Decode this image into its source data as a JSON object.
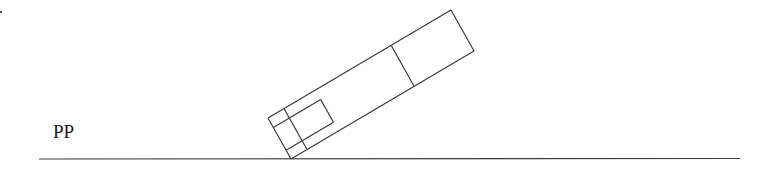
{
  "diagram": {
    "plane_label": "PP",
    "line_color": "#3a3a3a",
    "background": "#ffffff"
  }
}
